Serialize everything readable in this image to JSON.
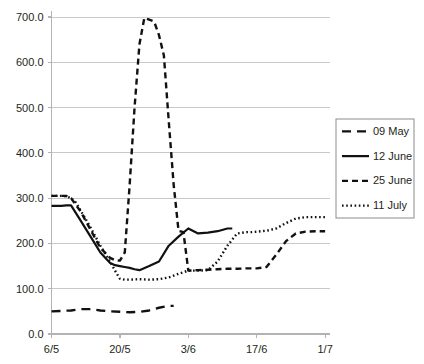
{
  "chart_data": {
    "type": "line",
    "title": "",
    "subtitle": "",
    "xlabel": "",
    "ylabel": "",
    "grid": true,
    "legend_position": "right",
    "ylim": [
      0.0,
      700.0
    ],
    "ytick_labels": [
      "0.0",
      "100.0",
      "200.0",
      "300.0",
      "400.0",
      "500.0",
      "600.0",
      "700.0"
    ],
    "ytick_values": [
      0,
      100,
      200,
      300,
      400,
      500,
      600,
      700
    ],
    "xtick_labels": [
      "6/5",
      "20/5",
      "3/6",
      "17/6",
      "1/7"
    ],
    "xtick_days": [
      0,
      14,
      28,
      42,
      56
    ],
    "xlim_days": [
      0,
      57
    ],
    "series": [
      {
        "name": "09 May",
        "style": "long-dash",
        "color": "#111111",
        "x_days": [
          0,
          2,
          4,
          6,
          8,
          10,
          12,
          14,
          16,
          18,
          20,
          22,
          24,
          25
        ],
        "values": [
          50,
          51,
          52,
          55,
          55,
          52,
          50,
          49,
          48,
          49,
          52,
          58,
          62,
          62
        ]
      },
      {
        "name": "12 June",
        "style": "solid",
        "color": "#111111",
        "x_days": [
          0,
          1,
          2,
          3,
          4,
          6,
          8,
          10,
          12,
          13,
          14,
          15,
          16,
          17,
          18,
          20,
          22,
          24,
          26,
          28,
          30,
          32,
          34,
          36,
          37
        ],
        "values": [
          283,
          283,
          283,
          284,
          284,
          250,
          215,
          180,
          157,
          152,
          150,
          148,
          146,
          143,
          141,
          150,
          160,
          195,
          215,
          233,
          222,
          224,
          227,
          233,
          233
        ]
      },
      {
        "name": "25 June",
        "style": "dash",
        "color": "#111111",
        "x_days": [
          0,
          1,
          2,
          3,
          4,
          6,
          8,
          10,
          12,
          13,
          14,
          15,
          16,
          17,
          18,
          19,
          20,
          21,
          22,
          23,
          24,
          25,
          26,
          27,
          28,
          30,
          32,
          34,
          36,
          38,
          40,
          42,
          44,
          46,
          48,
          50,
          52,
          54,
          56
        ],
        "values": [
          305,
          305,
          305,
          305,
          300,
          270,
          230,
          190,
          168,
          163,
          162,
          180,
          330,
          500,
          640,
          698,
          694,
          690,
          660,
          615,
          470,
          330,
          228,
          225,
          140,
          141,
          142,
          143,
          144,
          144,
          145,
          145,
          148,
          175,
          205,
          222,
          226,
          227,
          227
        ]
      },
      {
        "name": "11 July",
        "style": "dot",
        "color": "#111111",
        "x_days": [
          0,
          1,
          2,
          3,
          4,
          5,
          6,
          8,
          10,
          12,
          13,
          14,
          15,
          16,
          18,
          20,
          22,
          24,
          26,
          28,
          30,
          32,
          34,
          36,
          38,
          40,
          41,
          42,
          44,
          46,
          48,
          50,
          52,
          54,
          56
        ],
        "values": [
          305,
          305,
          305,
          304,
          300,
          290,
          272,
          235,
          195,
          160,
          140,
          122,
          120,
          120,
          121,
          120,
          121,
          125,
          133,
          140,
          140,
          141,
          160,
          195,
          222,
          225,
          225,
          226,
          228,
          233,
          245,
          255,
          258,
          258,
          258
        ]
      }
    ]
  },
  "legend": {
    "entries": [
      {
        "label": "09 May"
      },
      {
        "label": "12 June"
      },
      {
        "label": "25 June"
      },
      {
        "label": "11 July"
      }
    ]
  }
}
